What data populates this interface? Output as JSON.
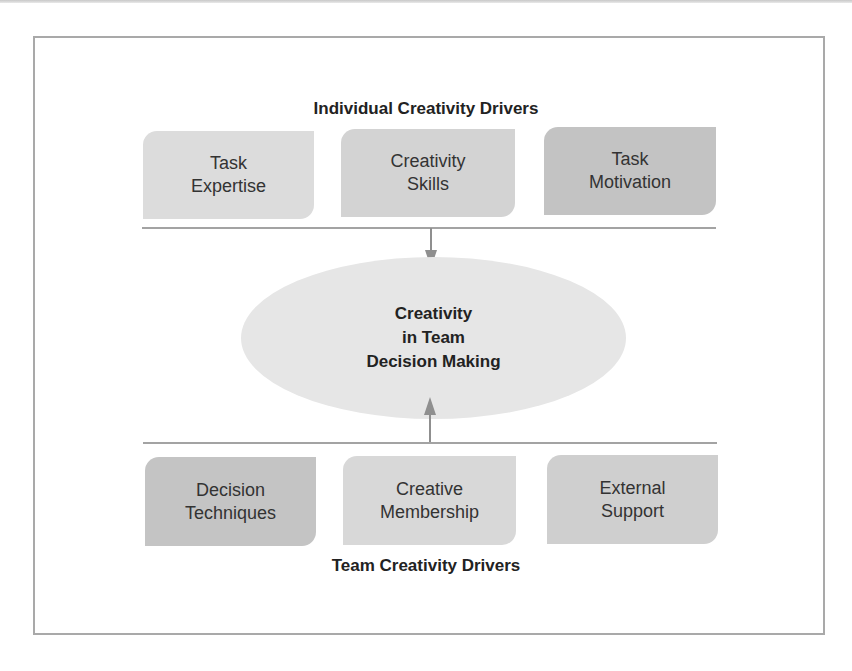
{
  "diagram": {
    "top_heading": "Individual Creativity Drivers",
    "bottom_heading": "Team Creativity Drivers",
    "center": {
      "lines": [
        "Creativity",
        "in Team",
        "Decision Making"
      ]
    },
    "individual_drivers": [
      {
        "line1": "Task",
        "line2": "Expertise",
        "color": "#dcdcdc"
      },
      {
        "line1": "Creativity",
        "line2": "Skills",
        "color": "#d3d3d3"
      },
      {
        "line1": "Task",
        "line2": "Motivation",
        "color": "#c3c3c3"
      }
    ],
    "team_drivers": [
      {
        "line1": "Decision",
        "line2": "Techniques",
        "color": "#c4c4c4"
      },
      {
        "line1": "Creative",
        "line2": "Membership",
        "color": "#d8d8d8"
      },
      {
        "line1": "External",
        "line2": "Support",
        "color": "#cfcfcf"
      }
    ],
    "arrows": [
      {
        "from": "Individual Creativity Drivers",
        "to": "Creativity in Team Decision Making",
        "direction": "down"
      },
      {
        "from": "Team Creativity Drivers",
        "to": "Creativity in Team Decision Making",
        "direction": "up"
      }
    ]
  }
}
